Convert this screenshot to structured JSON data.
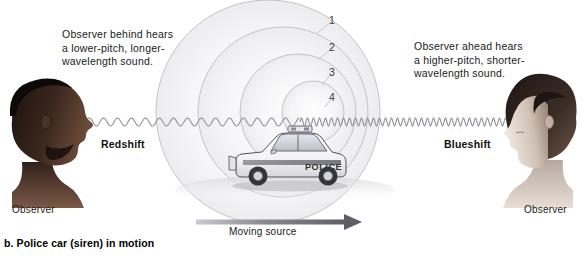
{
  "figure": {
    "caption": "b. Police car (siren) in motion",
    "moving_source_label": "Moving source"
  },
  "callouts": {
    "left": "Observer behind hears\na lower-pitch, longer-\nwavelength sound.",
    "right": "Observer ahead hears\na higher-pitch, shorter-\nwavelength sound."
  },
  "labels": {
    "redshift": "Redshift",
    "blueshift": "Blueshift",
    "observer_left": "Observer",
    "observer_right": "Observer"
  },
  "wavefronts": {
    "numbers": [
      "1",
      "2",
      "3",
      "4"
    ]
  },
  "vehicle": {
    "marking": "POLICE"
  },
  "colors": {
    "background": "#ffffff",
    "text": "#1a1a1a",
    "wavefront_stroke": "#b8b8bc",
    "wavefront_fill": "#f4f4f6",
    "sinewave_stroke": "#9a9aa0",
    "arrow_fill": "#6e6e76",
    "car_body": "#ffffff",
    "car_outline": "#4a4a50",
    "car_shadow": "#d9d9dd",
    "skin_left": "#2a1d17",
    "skin_right": "#cfc0b6",
    "hair_right": "#3a2e29"
  },
  "chart_data": {
    "type": "diagram",
    "wavefronts": [
      {
        "label": "1",
        "emitted_order": 1,
        "radius": 112,
        "center_x": 268,
        "number_x": 332,
        "number_y": 14
      },
      {
        "label": "2",
        "emitted_order": 2,
        "radius": 85,
        "center_x": 283,
        "number_x": 332,
        "number_y": 41
      },
      {
        "label": "3",
        "emitted_order": 3,
        "radius": 58,
        "center_x": 298,
        "number_x": 332,
        "number_y": 66
      },
      {
        "label": "4",
        "emitted_order": 4,
        "radius": 31,
        "center_x": 313,
        "number_x": 332,
        "number_y": 91
      }
    ],
    "observers": [
      {
        "side": "left",
        "position": "behind",
        "perceived_pitch": "lower",
        "perceived_wavelength": "longer",
        "shift": "Redshift",
        "wave_period_px": 14
      },
      {
        "side": "right",
        "position": "ahead",
        "perceived_pitch": "higher",
        "perceived_wavelength": "shorter",
        "shift": "Blueshift",
        "wave_period_px": 6
      }
    ],
    "source": {
      "label": "Moving source",
      "direction": "right",
      "arrow_from_x": 196,
      "arrow_to_x": 360,
      "arrow_y": 222
    }
  }
}
